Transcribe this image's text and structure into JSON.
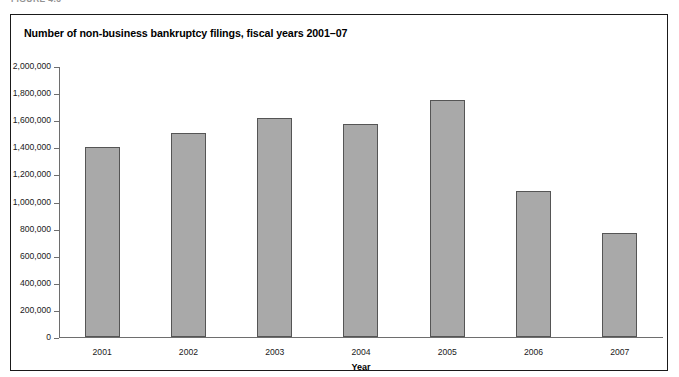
{
  "figure_label": "FIGURE 4.3",
  "frame": {
    "border_color": "#1a1a1a",
    "background": "#ffffff"
  },
  "chart_title": "Number of non-business bankruptcy filings, fiscal years 2001–07",
  "axis": {
    "color": "#6e6e6e",
    "bar_fill": "#a9a9a9",
    "bar_border": "#555555"
  },
  "chart_data": {
    "type": "bar",
    "title": "Number of non-business bankruptcy filings, fiscal years 2001–07",
    "xlabel": "Year",
    "ylabel": "",
    "categories": [
      "2001",
      "2002",
      "2003",
      "2004",
      "2005",
      "2006",
      "2007"
    ],
    "values": [
      1400000,
      1505000,
      1615000,
      1570000,
      1745000,
      1075000,
      765000
    ],
    "ylim": [
      0,
      2000000
    ],
    "ytick_values": [
      0,
      200000,
      400000,
      600000,
      800000,
      1000000,
      1200000,
      1400000,
      1600000,
      1800000,
      2000000
    ],
    "ytick_labels": [
      "0",
      "200,000",
      "400,000",
      "600,000",
      "800,000",
      "1,000,000",
      "1,200,000",
      "1,400,000",
      "1,600,000",
      "1,800,000",
      "2,000,000"
    ],
    "grid": false,
    "legend": null,
    "series_color": "#a9a9a9"
  }
}
